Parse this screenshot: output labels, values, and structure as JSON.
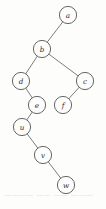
{
  "figure": {
    "background_color": "#fdfdfc",
    "stroke_color": "#5e5e5e",
    "edge_color": "#6e6e6e",
    "label_color": "#2b2b2b",
    "width": 106,
    "height": 209
  },
  "graph": {
    "type": "tree",
    "node_radius": 8.6,
    "nodes": [
      {
        "id": "a",
        "label": "a",
        "x": 68,
        "y": 15
      },
      {
        "id": "b",
        "label": "b",
        "x": 42,
        "y": 49
      },
      {
        "id": "d",
        "label": "d",
        "x": 21,
        "y": 81
      },
      {
        "id": "c",
        "label": "c",
        "x": 85,
        "y": 81
      },
      {
        "id": "e",
        "label": "e",
        "x": 37,
        "y": 105
      },
      {
        "id": "f",
        "label": "f",
        "x": 63,
        "y": 105
      },
      {
        "id": "u",
        "label": "u",
        "x": 22,
        "y": 127
      },
      {
        "id": "v",
        "label": "v",
        "x": 43,
        "y": 155
      },
      {
        "id": "w",
        "label": "w",
        "x": 66,
        "y": 185
      }
    ],
    "edges": [
      {
        "from": "a",
        "to": "b"
      },
      {
        "from": "b",
        "to": "d"
      },
      {
        "from": "b",
        "to": "c"
      },
      {
        "from": "d",
        "to": "e"
      },
      {
        "from": "c",
        "to": "f"
      },
      {
        "from": "e",
        "to": "u"
      },
      {
        "from": "u",
        "to": "v"
      },
      {
        "from": "v",
        "to": "w"
      }
    ]
  },
  "caption": {
    "text": "————    ——    ——  ———"
  }
}
